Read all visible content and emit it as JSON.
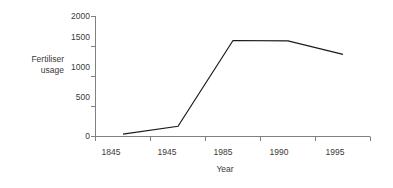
{
  "chart_data": {
    "type": "line",
    "title": "",
    "xlabel": "Year",
    "ylabel": "Fertiliser\nusage",
    "ylabel_line1": "Fertiliser",
    "ylabel_line2": "usage",
    "categories": [
      "1845",
      "1945",
      "1985",
      "1990",
      "1995"
    ],
    "values": [
      40,
      170,
      1600,
      1595,
      1370
    ],
    "series": [
      {
        "name": "Fertiliser usage",
        "values": [
          40,
          170,
          1600,
          1595,
          1370
        ],
        "color": "#1a1a1a"
      }
    ],
    "ylim": [
      0,
      2000
    ],
    "yticks": [
      "0",
      "500",
      "1000",
      "1500",
      "2000"
    ],
    "ytick_values": [
      0,
      500,
      1000,
      1500,
      2000
    ],
    "grid": false,
    "legend": false,
    "legend_position": "none",
    "axis_color": "#808080",
    "line_color": "#1a1a1a",
    "background": "#ffffff"
  },
  "yticks": {
    "t0": "0",
    "t1": "500",
    "t2": "1000",
    "t3": "1500",
    "t4": "2000"
  },
  "xticks": {
    "t0": "1845",
    "t1": "1945",
    "t2": "1985",
    "t3": "1990",
    "t4": "1995"
  },
  "axis_titles": {
    "x": "Year",
    "y_line1": "Fertiliser",
    "y_line2": "usage"
  }
}
